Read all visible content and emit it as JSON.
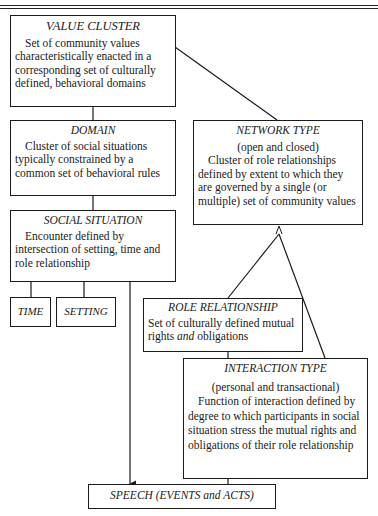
{
  "header": {
    "caption": "Figure 1. Relationships ..."
  },
  "diagram": {
    "value_cluster": {
      "title": "VALUE CLUSTER",
      "description": "Set of community values characteristically enacted in a corresponding set of culturally defined, behavioral domains"
    },
    "domain": {
      "title": "DOMAIN",
      "description": "Cluster of social situations typically constrained by a common set of behavioral rules"
    },
    "social_situation": {
      "title": "SOCIAL SITUATION",
      "description": "Encounter defined by intersection of setting, time and role relationship"
    },
    "time": {
      "title": "TIME"
    },
    "setting": {
      "title": "SETTING"
    },
    "network_type": {
      "title": "NETWORK TYPE",
      "subtitle": "(open and closed)",
      "description": "Cluster of role relationships defined by extent to which they are governed by a single (or multiple) set of community values"
    },
    "role_relationship": {
      "title": "ROLE RELATIONSHIP",
      "description_pre": "Set of culturally defined mutual rights ",
      "description_em": "and",
      "description_post": " obligations"
    },
    "interaction_type": {
      "title": "INTERACTION TYPE",
      "subtitle": "(personal and transactional)",
      "description": "Function of interaction defined by degree to which participants in social situation stress the mutual rights and obligations of their role relationship"
    },
    "speech": {
      "title": "SPEECH (EVENTS and ACTS)"
    }
  },
  "colors": {
    "line": "#1a1a1a",
    "background": "#ffffff"
  }
}
